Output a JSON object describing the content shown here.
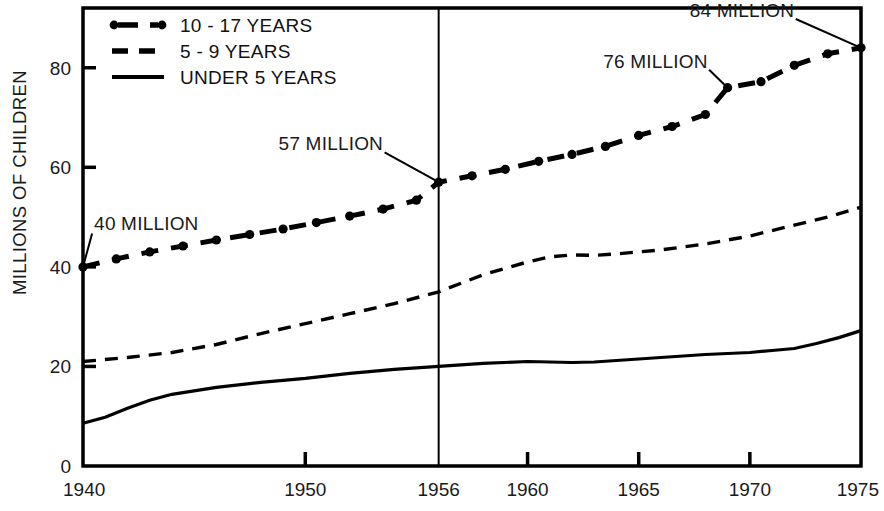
{
  "chart_data": {
    "type": "line",
    "title": "",
    "subtitle": "",
    "xlabel": "",
    "ylabel": "MILLIONS OF CHILDREN",
    "xlim": [
      1940,
      1975
    ],
    "ylim": [
      0,
      92
    ],
    "grid": false,
    "legend_position": "top-left",
    "x_ticks": [
      "1940",
      "1950",
      "1956",
      "1960",
      "1965",
      "1970",
      "1975"
    ],
    "x_tick_values": [
      1940,
      1950,
      1956,
      1960,
      1965,
      1970,
      1975
    ],
    "y_ticks": [
      "0",
      "20",
      "40",
      "60",
      "80"
    ],
    "y_tick_values": [
      0,
      20,
      40,
      60,
      80
    ],
    "reference_lines": [
      {
        "name": "year-1956-divider",
        "x": 1956,
        "orientation": "vertical"
      }
    ],
    "series": [
      {
        "name": "10 - 17 YEARS",
        "style": "dash-dot-with-dots",
        "color": "#000000",
        "x": [
          1940,
          1941.5,
          1943,
          1944.5,
          1946,
          1947.5,
          1949,
          1950.5,
          1952,
          1953.5,
          1955,
          1956,
          1957.5,
          1959,
          1960.5,
          1962,
          1963.5,
          1965,
          1966.5,
          1968,
          1969,
          1970.5,
          1972,
          1973.5,
          1975
        ],
        "values": [
          40.0,
          41.6,
          43.0,
          44.2,
          45.4,
          46.5,
          47.6,
          48.9,
          50.2,
          51.6,
          53.4,
          57.0,
          58.3,
          59.6,
          61.2,
          62.6,
          64.2,
          66.4,
          68.2,
          70.6,
          76.0,
          77.2,
          80.5,
          82.8,
          84.0
        ]
      },
      {
        "name": "5 - 9  YEARS",
        "style": "dashed",
        "color": "#000000",
        "x": [
          1940,
          1942,
          1944,
          1946,
          1948,
          1950,
          1952,
          1954,
          1956,
          1958,
          1960,
          1961,
          1962,
          1963,
          1964,
          1966,
          1968,
          1970,
          1972,
          1973.5,
          1975
        ],
        "values": [
          21.0,
          21.8,
          22.8,
          24.4,
          26.6,
          28.6,
          30.6,
          32.6,
          35.0,
          38.4,
          41.0,
          42.0,
          42.4,
          42.3,
          42.6,
          43.4,
          44.6,
          46.2,
          48.4,
          50.0,
          52.0
        ]
      },
      {
        "name": "UNDER 5 YEARS",
        "style": "solid",
        "color": "#000000",
        "x": [
          1940,
          1941,
          1942,
          1943,
          1944,
          1946,
          1948,
          1950,
          1952,
          1954,
          1956,
          1958,
          1960,
          1961,
          1962,
          1963,
          1964,
          1966,
          1968,
          1970,
          1971,
          1972,
          1973,
          1974,
          1975
        ],
        "values": [
          8.6,
          9.8,
          11.6,
          13.2,
          14.4,
          15.8,
          16.8,
          17.6,
          18.6,
          19.4,
          20.0,
          20.6,
          21.0,
          20.9,
          20.8,
          20.9,
          21.2,
          21.8,
          22.4,
          22.8,
          23.2,
          23.6,
          24.6,
          25.8,
          27.2
        ]
      }
    ],
    "annotations": [
      {
        "label": "40 MILLION",
        "text_x": 1940.5,
        "text_y": 47.5,
        "point_x": 1940,
        "point_y": 40.0,
        "anchor": "start"
      },
      {
        "label": "57 MILLION",
        "text_x": 1948.8,
        "text_y": 63.4,
        "point_x": 1956,
        "point_y": 57.0,
        "anchor": "start"
      },
      {
        "label": "76 MILLION",
        "text_x": 1963.4,
        "text_y": 80.0,
        "point_x": 1969,
        "point_y": 76.0,
        "anchor": "start"
      },
      {
        "label": "84 MILLION",
        "text_x": 1967.3,
        "text_y": 90.2,
        "point_x": 1975,
        "point_y": 84.0,
        "anchor": "start"
      }
    ]
  },
  "legend": {
    "items": [
      {
        "label": "10 - 17 YEARS",
        "style": "dash-dot-with-dots"
      },
      {
        "label": "5 - 9  YEARS",
        "style": "dashed"
      },
      {
        "label": "UNDER 5 YEARS",
        "style": "solid"
      }
    ]
  }
}
